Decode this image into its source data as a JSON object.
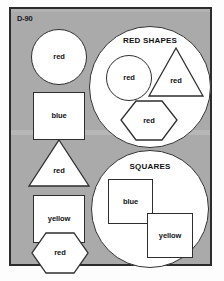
{
  "sheet": {
    "item_code": "D-90",
    "panel_background": "#aaaaaa",
    "shape_fill": "#ffffff",
    "outline_color": "#2e2e2e"
  },
  "loose_shapes": [
    {
      "name": "circle-red",
      "shape": "circle",
      "label": "red"
    },
    {
      "name": "square-blue",
      "shape": "square",
      "label": "blue"
    },
    {
      "name": "triangle-red",
      "shape": "triangle",
      "label": "red"
    },
    {
      "name": "square-yellow",
      "shape": "square",
      "label": "yellow"
    },
    {
      "name": "hexagon-red",
      "shape": "hexagon",
      "label": "red"
    }
  ],
  "groups": [
    {
      "name": "red-shapes",
      "title": "RED SHAPES",
      "members": [
        {
          "name": "circle-red",
          "shape": "circle",
          "label": "red"
        },
        {
          "name": "triangle-red",
          "shape": "triangle",
          "label": "red"
        },
        {
          "name": "hexagon-red",
          "shape": "hexagon",
          "label": "red"
        }
      ]
    },
    {
      "name": "squares",
      "title": "SQUARES",
      "members": [
        {
          "name": "square-blue",
          "shape": "square",
          "label": "blue"
        },
        {
          "name": "square-yellow",
          "shape": "square",
          "label": "yellow"
        }
      ]
    }
  ]
}
